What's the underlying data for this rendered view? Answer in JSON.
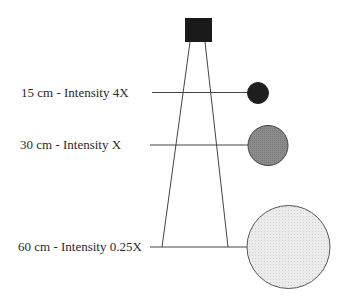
{
  "diagram": {
    "title": "",
    "source": {
      "name": "light-source",
      "color": "#1a1a1a"
    },
    "labels": [
      {
        "distance": "15 cm",
        "intensity": "4X",
        "text": "15 cm - Intensity 4X",
        "circle_color": "#1e1e1e"
      },
      {
        "distance": "30 cm",
        "intensity": "X",
        "text": "30 cm - Intensity X",
        "circle_color": "#8a8a8a"
      },
      {
        "distance": "60 cm",
        "intensity": "0.25X",
        "text": "60 cm - Intensity 0.25X",
        "circle_color": "#e4e4e4"
      }
    ],
    "colors": {
      "line": "#444444",
      "stroke": "#555555",
      "background": "#ffffff"
    }
  }
}
